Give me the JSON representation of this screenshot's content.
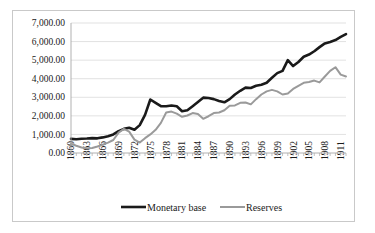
{
  "chart_data": {
    "type": "line",
    "title": "",
    "xlabel": "",
    "ylabel": "",
    "ylim": [
      0,
      7000
    ],
    "ytick_labels": [
      "0.00",
      "1,000.00",
      "2,000.00",
      "3,000.00",
      "4,000.00",
      "5,000.00",
      "6,000.00",
      "7,000.00"
    ],
    "ytick_values": [
      0,
      1000,
      2000,
      3000,
      4000,
      5000,
      6000,
      7000
    ],
    "grid": true,
    "legend_position": "bottom",
    "x": [
      1860,
      1861,
      1862,
      1863,
      1864,
      1865,
      1866,
      1867,
      1868,
      1869,
      1870,
      1871,
      1872,
      1873,
      1874,
      1875,
      1876,
      1877,
      1878,
      1879,
      1880,
      1881,
      1882,
      1883,
      1884,
      1885,
      1886,
      1887,
      1888,
      1889,
      1890,
      1891,
      1892,
      1893,
      1894,
      1895,
      1896,
      1897,
      1898,
      1899,
      1900,
      1901,
      1902,
      1903,
      1904,
      1905,
      1906,
      1907,
      1908,
      1909,
      1910,
      1911,
      1912
    ],
    "xtick_labels": [
      "1860",
      "1863",
      "1866",
      "1869",
      "1872",
      "1875",
      "1878",
      "1881",
      "1884",
      "1887",
      "1890",
      "1893",
      "1896",
      "1899",
      "1902",
      "1905",
      "1908",
      "1911"
    ],
    "xtick_values": [
      1860,
      1863,
      1866,
      1869,
      1872,
      1875,
      1878,
      1881,
      1884,
      1887,
      1890,
      1893,
      1896,
      1899,
      1902,
      1905,
      1908,
      1911
    ],
    "series": [
      {
        "name": "Monetary base",
        "color": "#1a1a1a",
        "width": 2.6,
        "values": [
          760,
          740,
          770,
          780,
          800,
          790,
          840,
          900,
          1000,
          1180,
          1300,
          1360,
          1250,
          1500,
          2050,
          2880,
          2700,
          2520,
          2520,
          2560,
          2520,
          2250,
          2300,
          2520,
          2750,
          2980,
          2960,
          2900,
          2800,
          2730,
          2900,
          3150,
          3350,
          3520,
          3500,
          3620,
          3680,
          3780,
          4050,
          4300,
          4420,
          5000,
          4680,
          4900,
          5180,
          5300,
          5480,
          5700,
          5900,
          5980,
          6080,
          6250,
          6400
        ]
      },
      {
        "name": "Reserves",
        "color": "#9a9a9a",
        "width": 2.0,
        "values": [
          500,
          390,
          300,
          260,
          270,
          350,
          450,
          560,
          700,
          1100,
          1300,
          1150,
          720,
          560,
          800,
          1000,
          1250,
          1620,
          2180,
          2230,
          2120,
          1950,
          2020,
          2150,
          2100,
          1840,
          1980,
          2150,
          2180,
          2300,
          2540,
          2560,
          2700,
          2720,
          2620,
          2900,
          3150,
          3320,
          3400,
          3320,
          3150,
          3200,
          3450,
          3620,
          3780,
          3820,
          3900,
          3800,
          4120,
          4420,
          4620,
          4220,
          4120
        ]
      }
    ]
  },
  "legend": {
    "entries": [
      {
        "label": "Monetary base"
      },
      {
        "label": "Reserves"
      }
    ]
  }
}
